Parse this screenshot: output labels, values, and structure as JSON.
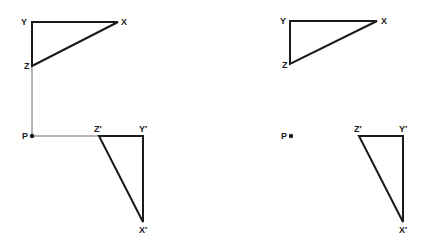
{
  "figure": {
    "panels": [
      {
        "id": "with-construction",
        "point": {
          "label": "P",
          "x": 32,
          "y": 136
        },
        "original": {
          "Y": {
            "label": "Y",
            "x": 32,
            "y": 22
          },
          "X": {
            "label": "X",
            "x": 118,
            "y": 22
          },
          "Z": {
            "label": "Z",
            "x": 32,
            "y": 66
          }
        },
        "image": {
          "Z": {
            "label": "Z′",
            "x": 99,
            "y": 136
          },
          "Y": {
            "label": "Y′",
            "x": 143,
            "y": 136
          },
          "X": {
            "label": "X′",
            "x": 143,
            "y": 222
          }
        },
        "construction_lines": true
      },
      {
        "id": "without-construction",
        "point": {
          "label": "P",
          "x": 291,
          "y": 136
        },
        "original": {
          "Y": {
            "label": "Y",
            "x": 290,
            "y": 21
          },
          "X": {
            "label": "X",
            "x": 377,
            "y": 21
          },
          "Z": {
            "label": "Z",
            "x": 290,
            "y": 64
          }
        },
        "image": {
          "Z": {
            "label": "Z′",
            "x": 359,
            "y": 136
          },
          "Y": {
            "label": "Y′",
            "x": 403,
            "y": 136
          },
          "X": {
            "label": "X′",
            "x": 403,
            "y": 222
          }
        },
        "construction_lines": false
      }
    ]
  },
  "labels": {
    "left": {
      "Y": "Y",
      "X": "X",
      "Z": "Z",
      "P": "P",
      "Zp": "Z′",
      "Yp": "Y′",
      "Xp": "X′"
    },
    "right": {
      "Y": "Y",
      "X": "X",
      "Z": "Z",
      "P": "P",
      "Zp": "Z′",
      "Yp": "Y′",
      "Xp": "X′"
    }
  }
}
